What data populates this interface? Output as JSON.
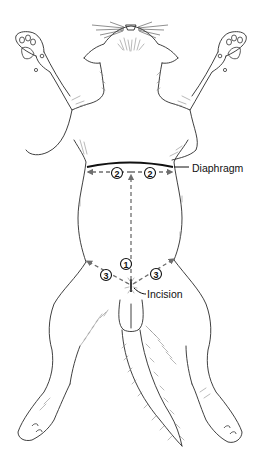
{
  "figure": {
    "labels": {
      "diaphragm": "Diaphragm",
      "incision": "Incision"
    },
    "steps": [
      {
        "number": "1",
        "description": "midline dashed arrow from incision toward diaphragm"
      },
      {
        "number": "2",
        "description": "dashed arrows along diaphragm, left and right"
      },
      {
        "number": "3",
        "description": "dashed arrows from incision toward flanks, left and right"
      }
    ],
    "step_markers": {
      "one": "1",
      "two_left": "2",
      "two_right": "2",
      "three_left": "3",
      "three_right": "3"
    },
    "colors": {
      "line_art": "#2a2a2a",
      "dashed_arrows": "#6e6e6e",
      "diaphragm_line": "#111111",
      "background": "#ffffff"
    }
  }
}
